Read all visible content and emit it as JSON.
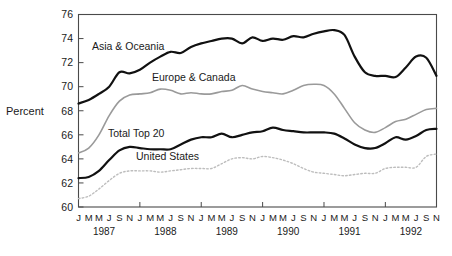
{
  "chart_data": {
    "type": "line",
    "title": "",
    "subtitle": "",
    "xlabel": "",
    "ylabel": "Percent",
    "ylim": [
      60,
      76
    ],
    "yticks": [
      60,
      62,
      64,
      66,
      68,
      70,
      72,
      74,
      76
    ],
    "grid": false,
    "legend_position": "inline-annotations",
    "x": [
      "1987-01",
      "1987-03",
      "1987-05",
      "1987-07",
      "1987-09",
      "1987-11",
      "1988-01",
      "1988-03",
      "1988-05",
      "1988-07",
      "1988-09",
      "1988-11",
      "1989-01",
      "1989-03",
      "1989-05",
      "1989-07",
      "1989-09",
      "1989-11",
      "1990-01",
      "1990-03",
      "1990-05",
      "1990-07",
      "1990-09",
      "1990-11",
      "1991-01",
      "1991-03",
      "1991-05",
      "1991-07",
      "1991-09",
      "1991-11",
      "1992-01",
      "1992-03",
      "1992-05",
      "1992-07",
      "1992-09",
      "1992-11"
    ],
    "xtick_months": [
      "J",
      "M",
      "M",
      "J",
      "S",
      "N",
      "J",
      "M",
      "M",
      "J",
      "S",
      "N",
      "J",
      "M",
      "M",
      "J",
      "S",
      "N",
      "J",
      "M",
      "M",
      "J",
      "S",
      "N",
      "J",
      "M",
      "M",
      "J",
      "S",
      "N",
      "J",
      "M",
      "M",
      "J",
      "S",
      "N"
    ],
    "xtick_years": [
      "1987",
      "1988",
      "1989",
      "1990",
      "1991",
      "1992"
    ],
    "series": [
      {
        "name": "Asia & Oceania",
        "style": "solid-thick-black",
        "color": "#111111",
        "values": [
          68.6,
          68.9,
          69.4,
          70.0,
          71.2,
          71.1,
          71.4,
          72.0,
          72.5,
          72.9,
          72.8,
          73.3,
          73.6,
          73.8,
          74.0,
          74.0,
          73.6,
          74.1,
          73.8,
          74.0,
          73.9,
          74.2,
          74.1,
          74.4,
          74.6,
          74.7,
          74.3,
          72.5,
          71.2,
          70.9,
          70.9,
          70.8,
          71.6,
          72.5,
          72.4,
          70.9
        ]
      },
      {
        "name": "Europe & Canada",
        "style": "solid-medium-gray",
        "color": "#9a9a9a",
        "values": [
          64.5,
          64.9,
          66.0,
          67.6,
          68.8,
          69.3,
          69.4,
          69.5,
          69.8,
          69.7,
          69.4,
          69.5,
          69.4,
          69.4,
          69.6,
          69.7,
          70.1,
          69.8,
          69.6,
          69.5,
          69.4,
          69.7,
          70.1,
          70.2,
          70.1,
          69.4,
          68.2,
          67.0,
          66.4,
          66.2,
          66.6,
          67.1,
          67.3,
          67.7,
          68.1,
          68.2
        ]
      },
      {
        "name": "Total Top 20",
        "style": "solid-thick-black",
        "color": "#111111",
        "values": [
          62.4,
          62.5,
          63.0,
          63.9,
          64.7,
          65.0,
          64.9,
          64.8,
          64.8,
          64.8,
          65.2,
          65.6,
          65.8,
          65.8,
          66.1,
          65.8,
          66.0,
          66.2,
          66.3,
          66.6,
          66.4,
          66.3,
          66.2,
          66.2,
          66.2,
          66.1,
          65.7,
          65.2,
          64.9,
          64.9,
          65.3,
          65.8,
          65.6,
          65.9,
          66.4,
          66.5
        ]
      },
      {
        "name": "United States",
        "style": "dotted-light-gray",
        "color": "#bdbdbd",
        "values": [
          60.7,
          60.9,
          61.5,
          62.2,
          62.8,
          63.0,
          63.0,
          63.0,
          62.9,
          63.0,
          63.1,
          63.2,
          63.2,
          63.2,
          63.6,
          64.0,
          64.1,
          64.0,
          64.2,
          64.1,
          63.9,
          63.6,
          63.2,
          62.9,
          62.8,
          62.7,
          62.6,
          62.7,
          62.8,
          62.8,
          63.2,
          63.3,
          63.3,
          63.3,
          64.2,
          64.4
        ]
      }
    ],
    "annotations": [
      {
        "text": "Asia & Oceania",
        "x_px": 92,
        "y_px": 50
      },
      {
        "text": "Europe & Canada",
        "x_px": 152,
        "y_px": 81
      },
      {
        "text": "Total Top 20",
        "x_px": 108,
        "y_px": 137
      },
      {
        "text": "United States",
        "x_px": 136,
        "y_px": 160
      }
    ]
  }
}
